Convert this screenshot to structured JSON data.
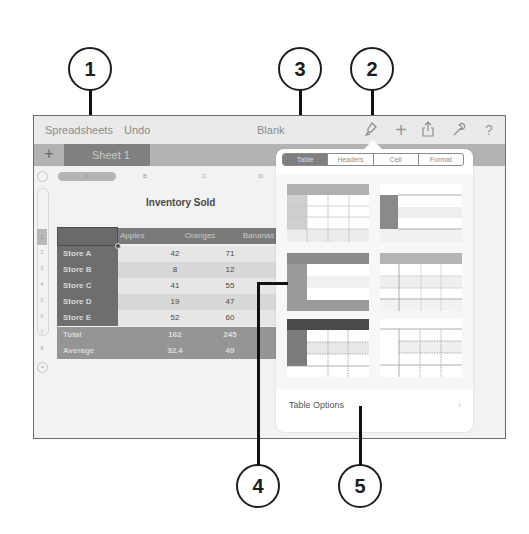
{
  "callouts": [
    {
      "number": "1"
    },
    {
      "number": "2"
    },
    {
      "number": "3"
    },
    {
      "number": "4"
    },
    {
      "number": "5"
    }
  ],
  "toolbar": {
    "spreadsheets_label": "Spreadsheets",
    "undo_label": "Undo",
    "doc_title": "Blank",
    "icons": [
      "paintbrush-icon",
      "plus-icon",
      "share-icon",
      "wrench-icon",
      "help-icon"
    ],
    "glyphs": {
      "paintbrush": "⚲",
      "plus": "+",
      "share": "⇪",
      "wrench": "🔧",
      "help": "?"
    }
  },
  "sheet_tabs": {
    "add_label": "+",
    "tabs": [
      {
        "label": "Sheet 1",
        "active": true
      }
    ]
  },
  "grid": {
    "column_letters": [
      "A",
      "B",
      "C",
      "D"
    ],
    "row_numbers": [
      "1",
      "2",
      "3",
      "4",
      "5",
      "6",
      "7",
      "8"
    ],
    "add_row_label": "="
  },
  "table": {
    "title": "Inventory Sold",
    "headers": [
      "",
      "Apples",
      "Oranges",
      "Bananas"
    ],
    "rows": [
      {
        "label": "Store A",
        "values": [
          "42",
          "71",
          ""
        ]
      },
      {
        "label": "Store B",
        "values": [
          "8",
          "12",
          ""
        ]
      },
      {
        "label": "Store C",
        "values": [
          "41",
          "55",
          ""
        ]
      },
      {
        "label": "Store D",
        "values": [
          "19",
          "47",
          ""
        ]
      },
      {
        "label": "Store E",
        "values": [
          "52",
          "60",
          ""
        ]
      }
    ],
    "footer": [
      {
        "label": "Total",
        "values": [
          "162",
          "245",
          "1"
        ]
      },
      {
        "label": "Average",
        "values": [
          "32.4",
          "49",
          "2"
        ]
      }
    ]
  },
  "popover": {
    "segments": [
      {
        "label": "Table",
        "active": true
      },
      {
        "label": "Headers",
        "active": false
      },
      {
        "label": "Cell",
        "active": false
      },
      {
        "label": "Format",
        "active": false
      }
    ],
    "table_styles": [
      "style-1",
      "style-2",
      "style-3",
      "style-4",
      "style-5",
      "style-6"
    ],
    "table_options_label": "Table Options",
    "chevron": "›"
  },
  "colors": {
    "frame_border": "#6e6e6e",
    "header_dark": "#7a7a7a",
    "row_label": "#6e6e6e",
    "footer": "#959595",
    "segment_active": "#7f7f7f",
    "callout_stroke": "#1e1e1e"
  }
}
